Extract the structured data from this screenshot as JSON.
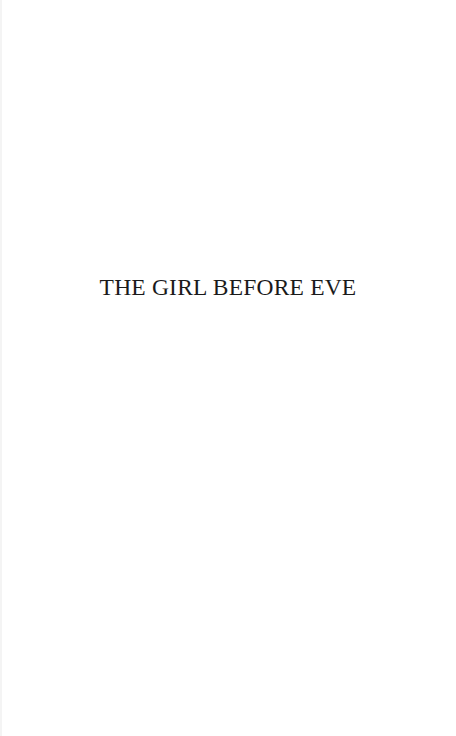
{
  "page": {
    "title": "THE GIRL BEFORE EVE",
    "text_color": "#1a1a1a",
    "background_color": "#ffffff"
  }
}
